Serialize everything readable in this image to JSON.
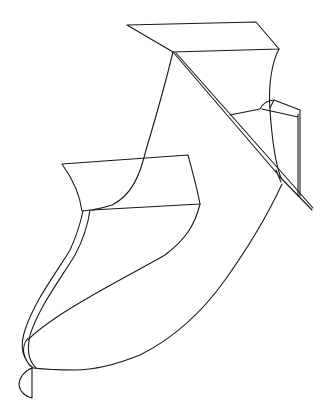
{
  "drawing": {
    "subject": "line sketch of a boot / shoe-like form",
    "stroke_color": "#1a1a1a",
    "background_color": "#ffffff",
    "parts": [
      "top-flap",
      "right-edge-curve",
      "diagonal-strap",
      "left-edge-curve",
      "middle-band",
      "side-tab",
      "lower-left-double-edge",
      "lower-inner-curve",
      "outer-sole-curve",
      "toe-tip"
    ]
  }
}
